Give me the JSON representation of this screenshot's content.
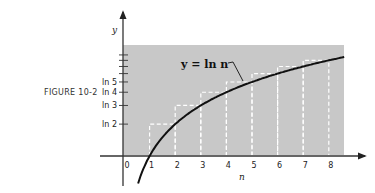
{
  "figure": {
    "caption": "FIGURE 10-2"
  },
  "colors": {
    "background": "#ffffff",
    "shaded_region": "#c8c8c8",
    "curve": "#111111",
    "steps": "#ffffff"
  },
  "chart_data": {
    "type": "line",
    "title": "FIGURE 10-2",
    "xlabel": "n",
    "ylabel": "y",
    "annotation": "y = ln n",
    "x_ticks": [
      "0",
      "1",
      "2",
      "3",
      "4",
      "5",
      "6",
      "7",
      "8"
    ],
    "y_ticks": [
      "ln 2",
      "ln 3",
      "ln 4",
      "ln 5"
    ],
    "y_minor_ticks": [
      "ln 6",
      "ln 7",
      "ln 8",
      "ln 9"
    ],
    "curve": {
      "name": "y = ln n",
      "x": [
        0.55,
        1,
        2,
        3,
        4,
        5,
        6,
        7,
        8,
        8.6
      ],
      "y": [
        -0.598,
        0,
        0.693,
        1.099,
        1.386,
        1.609,
        1.792,
        1.946,
        2.079,
        2.152
      ]
    },
    "steps": {
      "name": "upper rectangles (dashed)",
      "intervals": [
        [
          1,
          2
        ],
        [
          2,
          3
        ],
        [
          3,
          4
        ],
        [
          4,
          5
        ],
        [
          5,
          6
        ],
        [
          6,
          7
        ],
        [
          7,
          8
        ]
      ],
      "heights_label": [
        "ln 2",
        "ln 3",
        "ln 4",
        "ln 5",
        "ln 6",
        "ln 7",
        "ln 8"
      ],
      "heights": [
        0.693,
        1.099,
        1.386,
        1.609,
        1.792,
        1.946,
        2.079
      ]
    },
    "shaded_region": {
      "x": [
        0,
        8.6
      ],
      "y": [
        0,
        2.4
      ]
    },
    "xlim": [
      -0.1,
      9.5
    ],
    "ylim": [
      -0.8,
      3.3
    ],
    "grid": false
  },
  "labels": {
    "x_axis": "n",
    "y_axis": "y",
    "curve": "y = ln n",
    "x_ticks": [
      "0",
      "1",
      "2",
      "3",
      "4",
      "5",
      "6",
      "7",
      "8"
    ],
    "y_ticks": [
      "ln 2",
      "ln 3",
      "ln 4",
      "ln 5"
    ]
  }
}
